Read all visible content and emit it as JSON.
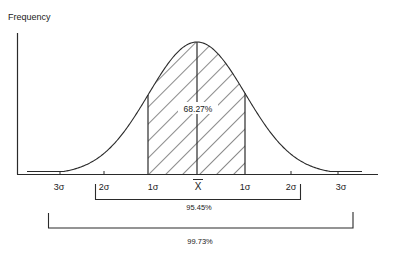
{
  "y_axis_label": "Frequency",
  "center_label": "X",
  "center_label_note": "X-bar (mean)",
  "ticks": {
    "left_3": "3σ",
    "left_2": "2σ",
    "left_1": "1σ",
    "right_1": "1σ",
    "right_2": "2σ",
    "right_3": "3σ"
  },
  "areas": {
    "one_sigma": "68.27%",
    "two_sigma": "95.45%",
    "three_sigma": "99.73%"
  },
  "colors": {
    "line": "#2a2a2a",
    "background": "#ffffff"
  }
}
